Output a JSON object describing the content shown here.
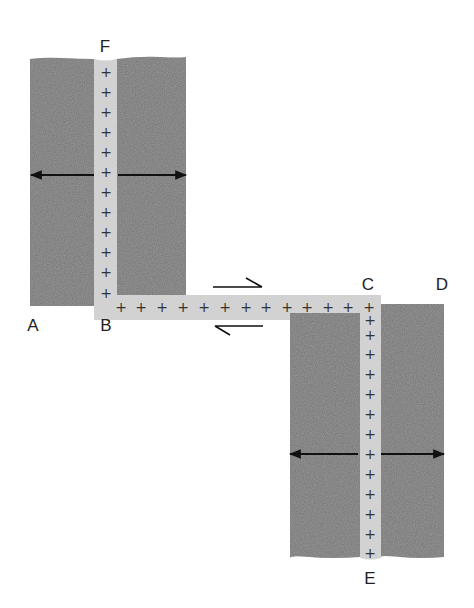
{
  "diagram": {
    "type": "geology-transform-fault",
    "colors": {
      "block": "#727272",
      "block_edge": "#6a6a6a",
      "strip": "#cfcfcf",
      "arrow": "#111111",
      "label": "#222222",
      "plus": "#333333"
    },
    "labels": {
      "F": "F",
      "A": "A",
      "B": "B",
      "C": "C",
      "D": "D",
      "E": "E"
    },
    "label_positions": {
      "F": [
        105,
        52
      ],
      "A": [
        33,
        331
      ],
      "B": [
        106,
        331
      ],
      "C": [
        368,
        290
      ],
      "D": [
        442,
        290
      ],
      "E": [
        370,
        584
      ]
    },
    "plus_symbol": "+",
    "plus_upper_ridge": [
      [
        106,
        77
      ],
      [
        106,
        97
      ],
      [
        106,
        117
      ],
      [
        106,
        137
      ],
      [
        106,
        157
      ],
      [
        106,
        177
      ],
      [
        106,
        197
      ],
      [
        106,
        217
      ],
      [
        106,
        237
      ],
      [
        106,
        257
      ],
      [
        106,
        277
      ],
      [
        106,
        298
      ]
    ],
    "plus_transform": [
      [
        121,
        312
      ],
      [
        141,
        312
      ],
      [
        162,
        312
      ],
      [
        183,
        312
      ],
      [
        204,
        312
      ],
      [
        225,
        312
      ],
      [
        246,
        312
      ],
      [
        266,
        312
      ],
      [
        287,
        312
      ],
      [
        307,
        312
      ],
      [
        328,
        312
      ],
      [
        348,
        312
      ],
      [
        369,
        312
      ]
    ],
    "plus_lower_ridge": [
      [
        370,
        325
      ],
      [
        370,
        340
      ],
      [
        370,
        359
      ],
      [
        370,
        379
      ],
      [
        370,
        399
      ],
      [
        370,
        419
      ],
      [
        370,
        439
      ],
      [
        370,
        459
      ],
      [
        370,
        479
      ],
      [
        370,
        499
      ],
      [
        370,
        519
      ],
      [
        370,
        539
      ],
      [
        370,
        558
      ]
    ],
    "spreading_arrows": [
      {
        "from": [
          94,
          175
        ],
        "to": [
          31,
          175
        ],
        "name": "upper-left-spreading-arrow"
      },
      {
        "from": [
          118,
          175
        ],
        "to": [
          186,
          175
        ],
        "name": "upper-right-spreading-arrow"
      },
      {
        "from": [
          358,
          454
        ],
        "to": [
          290,
          454
        ],
        "name": "lower-left-spreading-arrow"
      },
      {
        "from": [
          381,
          454
        ],
        "to": [
          444,
          454
        ],
        "name": "lower-right-spreading-arrow"
      }
    ],
    "shear_arrows": [
      {
        "name": "upper-shear-half-arrow",
        "line": [
          [
            213,
            287
          ],
          [
            262,
            287
          ]
        ],
        "barb": [
          [
            262,
            287
          ],
          [
            246,
            278
          ]
        ]
      },
      {
        "name": "lower-shear-half-arrow",
        "line": [
          [
            215,
            326
          ],
          [
            263,
            326
          ]
        ],
        "barb": [
          [
            215,
            326
          ],
          [
            230,
            335
          ]
        ]
      }
    ]
  }
}
